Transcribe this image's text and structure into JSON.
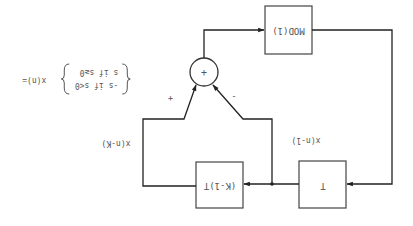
{
  "diagram": {
    "orientation": "rotated-180",
    "colors": {
      "line": "#222222",
      "box_border": "#444444",
      "text": "#555555",
      "background": "#ffffff"
    },
    "blocks": [
      {
        "id": "mod",
        "label": "MOD(1)"
      },
      {
        "id": "delay_t",
        "label": "T"
      },
      {
        "id": "delay_k",
        "label": "(K-1)T"
      }
    ],
    "adder": {
      "symbol": "+",
      "input_signs": [
        "+",
        "-"
      ]
    },
    "signals": {
      "x_n_1": "x(n-1)",
      "x_n_k": "x(n-K)"
    },
    "equation": {
      "lhs": "x(n)=",
      "case1": "s   if  s≥0",
      "case2": "-s  if  s<0"
    }
  }
}
